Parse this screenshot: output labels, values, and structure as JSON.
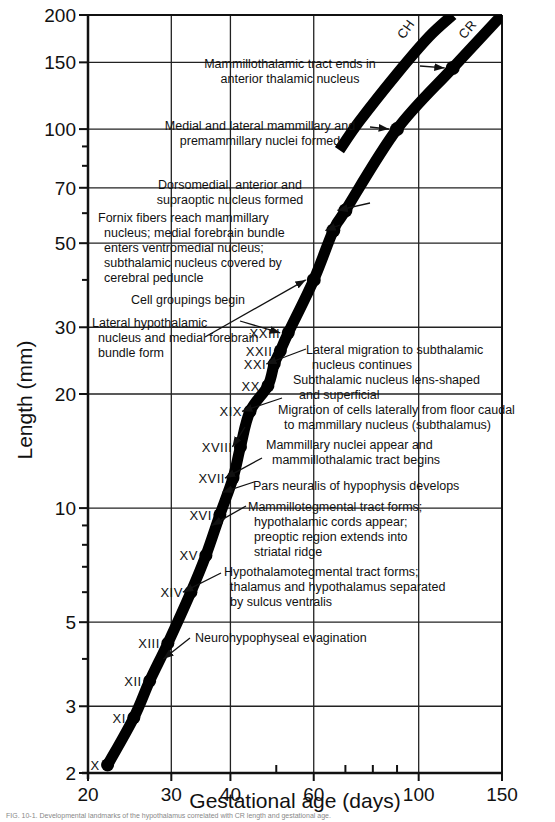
{
  "chart_data": {
    "type": "line",
    "title": "",
    "xlabel": "Gestational age (days)",
    "ylabel": "Length (mm)",
    "xscale": "log",
    "yscale": "log",
    "xlim": [
      20,
      150
    ],
    "ylim": [
      2,
      200
    ],
    "x_ticks": [
      20,
      30,
      40,
      60,
      100,
      150
    ],
    "x_minor_ticks": [
      50,
      70,
      80,
      90
    ],
    "y_ticks": [
      2,
      3,
      5,
      10,
      20,
      30,
      50,
      70,
      100,
      150,
      200
    ],
    "y_minor_ticks": [
      4,
      6,
      7,
      8,
      9,
      40,
      60,
      80,
      90
    ],
    "grid": true,
    "series": [
      {
        "name": "CR",
        "points": [
          [
            22,
            2.1
          ],
          [
            25,
            2.8
          ],
          [
            27,
            3.5
          ],
          [
            29.5,
            4.4
          ],
          [
            33,
            6
          ],
          [
            35.5,
            7.5
          ],
          [
            38,
            9.6
          ],
          [
            40.5,
            12
          ],
          [
            42,
            14.5
          ],
          [
            44,
            18
          ],
          [
            48,
            21
          ],
          [
            49.5,
            24
          ],
          [
            51,
            26
          ],
          [
            53,
            29
          ],
          [
            60,
            40
          ],
          [
            66,
            54
          ],
          [
            70,
            61
          ],
          [
            90,
            100
          ],
          [
            118,
            145
          ],
          [
            150,
            200
          ]
        ]
      },
      {
        "name": "CH",
        "points": [
          [
            68,
            88
          ],
          [
            75,
            105
          ],
          [
            90,
            140
          ],
          [
            105,
            175
          ],
          [
            118,
            200
          ]
        ]
      }
    ],
    "stages": [
      {
        "label": "X",
        "x": 22,
        "y": 2.1
      },
      {
        "label": "XI",
        "x": 25,
        "y": 2.8
      },
      {
        "label": "XII",
        "x": 27,
        "y": 3.5
      },
      {
        "label": "XIII",
        "x": 29.5,
        "y": 4.4
      },
      {
        "label": "XIV",
        "x": 33,
        "y": 6
      },
      {
        "label": "XV",
        "x": 35.5,
        "y": 7.5
      },
      {
        "label": "XVI",
        "x": 38,
        "y": 9.6
      },
      {
        "label": "XVII",
        "x": 40.5,
        "y": 12
      },
      {
        "label": "XVIII",
        "x": 42,
        "y": 14.5
      },
      {
        "label": "XIX",
        "x": 44,
        "y": 18
      },
      {
        "label": "XX",
        "x": 48,
        "y": 21
      },
      {
        "label": "XXI",
        "x": 49.5,
        "y": 24
      },
      {
        "label": "XXII",
        "x": 51,
        "y": 26
      },
      {
        "label": "XXIII",
        "x": 53,
        "y": 29
      }
    ],
    "annotations": [
      {
        "lines": [
          "Mammillothalamic tract ends in",
          "anterior thalamic nucleus"
        ],
        "target": [
          118,
          145
        ]
      },
      {
        "lines": [
          "Medial and lateral mammillary and",
          "premammillary nuclei formed"
        ],
        "target": [
          90,
          100
        ]
      },
      {
        "lines": [
          "Dorsomedial, anterior and",
          "supraoptic nucleus formed"
        ],
        "target": [
          70,
          61
        ]
      },
      {
        "lines": [
          "Fornix fibers reach mammillary",
          "nucleus; medial forebrain bundle",
          "enters ventromedial nucleus;",
          "subthalamic nucleus covered by",
          "cerebral peduncle"
        ],
        "target": [
          66,
          54
        ]
      },
      {
        "lines": [
          "Cell groupings begin"
        ],
        "target": [
          60,
          40
        ]
      },
      {
        "lines": [
          "Lateral hypothalamic",
          "nucleus and medial forebrain",
          "bundle form"
        ],
        "target": [
          53,
          29
        ]
      },
      {
        "lines": [
          "Lateral migration to subthalamic",
          "nucleus continues"
        ],
        "target": [
          49.5,
          24
        ]
      },
      {
        "lines": [
          "Subthalamic nucleus lens-shaped",
          "and superficial"
        ],
        "target": [
          44,
          18
        ]
      },
      {
        "lines": [
          "Migration of cells laterally from floor caudal",
          "to mammillary nucleus (subthalamus)"
        ],
        "target": [
          42,
          14.5
        ]
      },
      {
        "lines": [
          "Mammillary nuclei appear and",
          "mammillothalamic tract begins"
        ],
        "target": [
          40.5,
          12
        ]
      },
      {
        "lines": [
          "Pars neuralis of hypophysis develops"
        ],
        "target": [
          40,
          11
        ]
      },
      {
        "lines": [
          "Mammillotegmental tract forms;",
          "hypothalamic cords appear;",
          "preoptic region extends into",
          "striatal ridge"
        ],
        "target": [
          38,
          9
        ]
      },
      {
        "lines": [
          "Hypothalamotegmental tract forms;",
          "thalamus and hypothalamus separated",
          "by sulcus ventralis"
        ],
        "target": [
          33,
          6
        ]
      },
      {
        "lines": [
          "Neurohypophyseal evagination"
        ],
        "target": [
          30,
          4
        ]
      }
    ]
  },
  "caption": "FIG. 10-1. Developmental landmarks of the hypothalamus correlated with CR length and gestational age."
}
